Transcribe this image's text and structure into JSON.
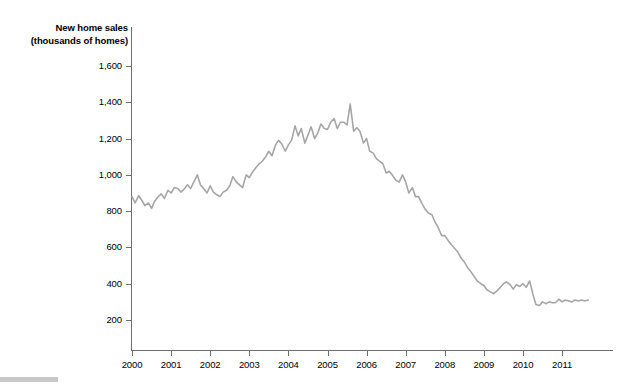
{
  "chart_data": {
    "type": "line",
    "title": "",
    "ylabel_line1": "New home sales",
    "ylabel_line2": "(thousands of homes)",
    "xlabel": "",
    "ylim": [
      0,
      1700
    ],
    "xlim": [
      2000,
      2011.75
    ],
    "grid": false,
    "legend": null,
    "series_color": "#a6a6a6",
    "axis_color": "#6e6e6e",
    "y_ticks": [
      {
        "value": 1600,
        "label": "1,600"
      },
      {
        "value": 1400,
        "label": "1,400"
      },
      {
        "value": 1200,
        "label": "1,200"
      },
      {
        "value": 1000,
        "label": "1,000"
      },
      {
        "value": 800,
        "label": "800"
      },
      {
        "value": 600,
        "label": "600"
      },
      {
        "value": 400,
        "label": "400"
      },
      {
        "value": 200,
        "label": "200"
      }
    ],
    "x_ticks": [
      {
        "value": 2000,
        "label": "2000"
      },
      {
        "value": 2001,
        "label": "2001"
      },
      {
        "value": 2002,
        "label": "2002"
      },
      {
        "value": 2003,
        "label": "2003"
      },
      {
        "value": 2004,
        "label": "2004"
      },
      {
        "value": 2005,
        "label": "2005"
      },
      {
        "value": 2006,
        "label": "2006"
      },
      {
        "value": 2007,
        "label": "2007"
      },
      {
        "value": 2008,
        "label": "2008"
      },
      {
        "value": 2009,
        "label": "2009"
      },
      {
        "value": 2010,
        "label": "2010"
      },
      {
        "value": 2011,
        "label": "2011"
      }
    ],
    "series": [
      {
        "name": "New home sales",
        "x": [
          2000.0,
          2000.08,
          2000.17,
          2000.25,
          2000.33,
          2000.42,
          2000.5,
          2000.58,
          2000.67,
          2000.75,
          2000.83,
          2000.92,
          2001.0,
          2001.08,
          2001.17,
          2001.25,
          2001.33,
          2001.42,
          2001.5,
          2001.58,
          2001.67,
          2001.75,
          2001.83,
          2001.92,
          2002.0,
          2002.08,
          2002.17,
          2002.25,
          2002.33,
          2002.42,
          2002.5,
          2002.58,
          2002.67,
          2002.75,
          2002.83,
          2002.92,
          2003.0,
          2003.08,
          2003.17,
          2003.25,
          2003.33,
          2003.42,
          2003.5,
          2003.58,
          2003.67,
          2003.75,
          2003.83,
          2003.92,
          2004.0,
          2004.08,
          2004.17,
          2004.25,
          2004.33,
          2004.42,
          2004.5,
          2004.58,
          2004.67,
          2004.75,
          2004.83,
          2004.92,
          2005.0,
          2005.08,
          2005.17,
          2005.25,
          2005.33,
          2005.42,
          2005.5,
          2005.58,
          2005.67,
          2005.75,
          2005.83,
          2005.92,
          2006.0,
          2006.08,
          2006.17,
          2006.25,
          2006.33,
          2006.42,
          2006.5,
          2006.58,
          2006.67,
          2006.75,
          2006.83,
          2006.92,
          2007.0,
          2007.08,
          2007.17,
          2007.25,
          2007.33,
          2007.42,
          2007.5,
          2007.58,
          2007.67,
          2007.75,
          2007.83,
          2007.92,
          2008.0,
          2008.08,
          2008.17,
          2008.25,
          2008.33,
          2008.42,
          2008.5,
          2008.58,
          2008.67,
          2008.75,
          2008.83,
          2008.92,
          2009.0,
          2009.08,
          2009.17,
          2009.25,
          2009.33,
          2009.42,
          2009.5,
          2009.58,
          2009.67,
          2009.75,
          2009.83,
          2009.92,
          2010.0,
          2010.08,
          2010.17,
          2010.25,
          2010.33,
          2010.42,
          2010.5,
          2010.58,
          2010.67,
          2010.75,
          2010.83,
          2010.92,
          2011.0,
          2011.08,
          2011.17,
          2011.25,
          2011.33,
          2011.42,
          2011.5,
          2011.58,
          2011.67
        ],
        "values": [
          880,
          845,
          885,
          860,
          830,
          845,
          815,
          855,
          880,
          895,
          870,
          915,
          900,
          930,
          925,
          905,
          920,
          945,
          925,
          960,
          1000,
          945,
          925,
          900,
          940,
          905,
          890,
          880,
          905,
          915,
          940,
          990,
          960,
          945,
          930,
          1000,
          985,
          1015,
          1040,
          1060,
          1075,
          1100,
          1130,
          1105,
          1165,
          1190,
          1170,
          1130,
          1165,
          1190,
          1270,
          1215,
          1255,
          1175,
          1220,
          1265,
          1200,
          1230,
          1280,
          1255,
          1250,
          1290,
          1310,
          1255,
          1290,
          1290,
          1275,
          1390,
          1240,
          1260,
          1240,
          1175,
          1200,
          1130,
          1120,
          1090,
          1075,
          1060,
          1010,
          1020,
          995,
          970,
          960,
          1000,
          960,
          900,
          930,
          880,
          880,
          840,
          810,
          790,
          780,
          740,
          710,
          665,
          665,
          640,
          615,
          595,
          575,
          540,
          520,
          490,
          465,
          440,
          415,
          400,
          390,
          365,
          355,
          345,
          360,
          380,
          400,
          410,
          395,
          370,
          395,
          385,
          400,
          380,
          415,
          345,
          285,
          280,
          300,
          290,
          300,
          295,
          295,
          315,
          300,
          310,
          305,
          300,
          310,
          305,
          310,
          305,
          310
        ]
      }
    ]
  },
  "footer": {
    "bar_color": "#c9c9c9"
  }
}
